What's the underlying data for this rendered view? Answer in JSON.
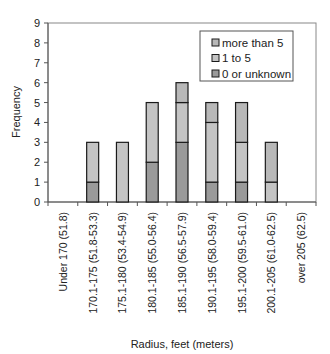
{
  "chart_data": {
    "type": "bar",
    "stacked": true,
    "title": "",
    "xlabel": "Radius, feet (meters)",
    "ylabel": "Frequency",
    "ylim": [
      0,
      9
    ],
    "yticks": [
      0,
      1,
      2,
      3,
      4,
      5,
      6,
      7,
      8,
      9
    ],
    "grid": false,
    "legend_position": "upper right",
    "categories": [
      "Under 170 (51.8)",
      "170.1-175 (51.8-53.3)",
      "175.1-180 (53.4-54.9)",
      "180.1-185 (55.0-56.4)",
      "185.1-190 (56.5-57.9)",
      "190.1-195 (58.0-59.4)",
      "195.1-200 (59.5-61.0)",
      "200.1-205 (61.0-62.5)",
      "over 205 (62.5)"
    ],
    "series": [
      {
        "name": "0 or unknown",
        "color": "#9a9a9a",
        "values": [
          0,
          1,
          0,
          2,
          3,
          1,
          1,
          0,
          0
        ]
      },
      {
        "name": "1 to 5",
        "color": "#c4c4c4",
        "values": [
          0,
          2,
          3,
          3,
          2,
          3,
          2,
          1,
          0
        ]
      },
      {
        "name": "more than 5",
        "color": "#b8b8b8",
        "values": [
          0,
          0,
          0,
          0,
          1,
          1,
          2,
          2,
          0
        ]
      }
    ],
    "legend_order": [
      "more than 5",
      "1 to 5",
      "0 or unknown"
    ]
  }
}
